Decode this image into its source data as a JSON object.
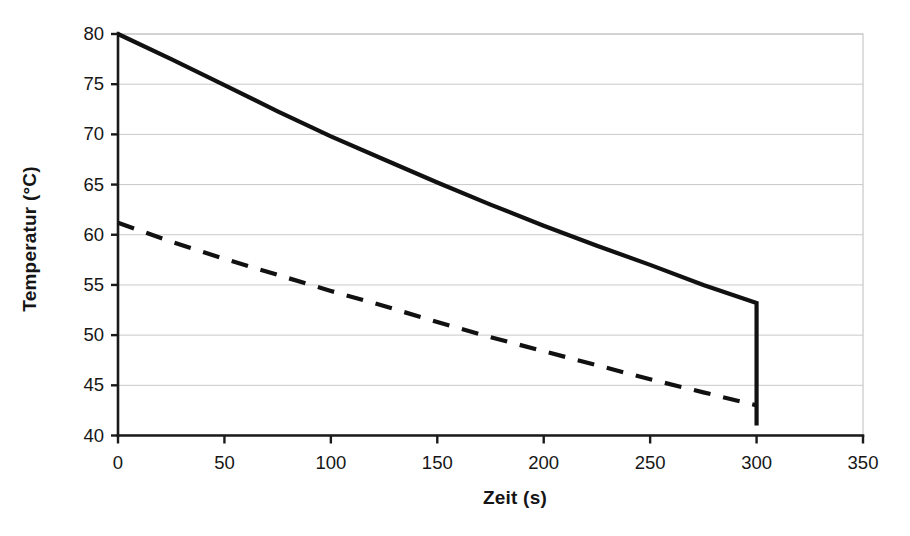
{
  "chart_data": {
    "type": "line",
    "title": "",
    "xlabel": "Zeit (s)",
    "ylabel": "Temperatur (°C)",
    "xlim": [
      0,
      350
    ],
    "ylim": [
      40,
      80
    ],
    "xticks": [
      0,
      50,
      100,
      150,
      200,
      250,
      300,
      350
    ],
    "yticks": [
      40,
      45,
      50,
      55,
      60,
      65,
      70,
      75,
      80
    ],
    "grid": "horizontal",
    "legend": "none",
    "series": [
      {
        "name": "solid-curve",
        "style": "solid",
        "color": "#111111",
        "x": [
          0,
          25,
          50,
          75,
          100,
          125,
          150,
          175,
          200,
          225,
          250,
          275,
          300,
          300
        ],
        "y": [
          80.0,
          77.5,
          74.9,
          72.3,
          69.8,
          67.5,
          65.2,
          63.0,
          60.9,
          58.9,
          57.0,
          55.0,
          53.2,
          41.0
        ]
      },
      {
        "name": "dashed-curve",
        "style": "dashed",
        "color": "#111111",
        "x": [
          0,
          25,
          50,
          75,
          100,
          125,
          150,
          175,
          200,
          225,
          250,
          275,
          300
        ],
        "y": [
          61.2,
          59.3,
          57.6,
          56.0,
          54.4,
          52.9,
          51.3,
          49.8,
          48.4,
          47.0,
          45.6,
          44.3,
          43.0
        ]
      }
    ],
    "annotations": [
      {
        "name": "solid-dropoff",
        "description": "vertical drop of solid curve at t=300 s from 53.2 to 41.0"
      }
    ]
  },
  "axes": {
    "y_tick_labels": [
      "80",
      "75",
      "70",
      "65",
      "60",
      "55",
      "50",
      "45",
      "40"
    ],
    "x_tick_labels": [
      "0",
      "50",
      "100",
      "150",
      "200",
      "250",
      "300",
      "350"
    ],
    "x_title": "Zeit (s)",
    "y_title": "Temperatur (°C)"
  },
  "colors": {
    "line": "#111111",
    "grid": "#c9c9c9",
    "axis": "#1a1a1a",
    "background": "#ffffff"
  }
}
